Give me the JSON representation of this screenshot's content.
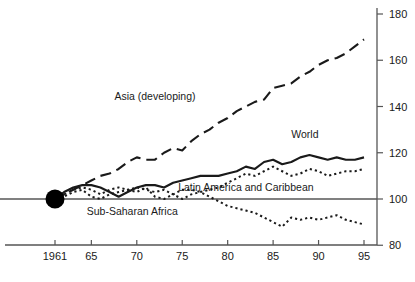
{
  "chart_data": {
    "type": "line",
    "title": "",
    "subtitle": "",
    "xlabel": "",
    "ylabel": "",
    "xlim": [
      1961,
      1996
    ],
    "ylim": [
      80,
      180
    ],
    "grid": false,
    "legend_position": "inline-annotations",
    "reference_line": {
      "value": 100,
      "color": "#808080",
      "label": ""
    },
    "origin_marker": {
      "x": 1961,
      "y": 100,
      "shape": "filled-circle",
      "color": "#000000"
    },
    "x_ticks": [
      {
        "value": 1961,
        "label": "1961"
      },
      {
        "value": 1965,
        "label": "65"
      },
      {
        "value": 1970,
        "label": "70"
      },
      {
        "value": 1975,
        "label": "75"
      },
      {
        "value": 1980,
        "label": "80"
      },
      {
        "value": 1985,
        "label": "85"
      },
      {
        "value": 1990,
        "label": "90"
      },
      {
        "value": 1995,
        "label": "95"
      }
    ],
    "y_ticks": [
      {
        "value": 80,
        "label": "80"
      },
      {
        "value": 100,
        "label": "100"
      },
      {
        "value": 120,
        "label": "120"
      },
      {
        "value": 140,
        "label": "140"
      },
      {
        "value": 160,
        "label": "160"
      },
      {
        "value": 180,
        "label": "180"
      }
    ],
    "x": [
      1961,
      1962,
      1963,
      1964,
      1965,
      1966,
      1967,
      1968,
      1969,
      1970,
      1971,
      1972,
      1973,
      1974,
      1975,
      1976,
      1977,
      1978,
      1979,
      1980,
      1981,
      1982,
      1983,
      1984,
      1985,
      1986,
      1987,
      1988,
      1989,
      1990,
      1991,
      1992,
      1993,
      1994,
      1995
    ],
    "series": [
      {
        "name": "Asia (developing)",
        "style": "long-dash",
        "color": "#1a1a1a",
        "label_x": 1972.0,
        "label_y": 143.0,
        "values": [
          100,
          102,
          104,
          106,
          108,
          110,
          111,
          113,
          116,
          118,
          117,
          117,
          120,
          122,
          121,
          125,
          128,
          130,
          133,
          135,
          138,
          140,
          142,
          143,
          148,
          149,
          150,
          153,
          155,
          158,
          160,
          161,
          163,
          166,
          169
        ]
      },
      {
        "name": "World",
        "style": "solid",
        "color": "#1a1a1a",
        "label_x": 1988.5,
        "label_y": 126.5,
        "values": [
          100,
          103,
          105,
          106,
          106,
          105,
          103,
          101,
          103,
          105,
          106,
          106,
          105,
          107,
          108,
          109,
          110,
          110,
          110,
          111,
          112,
          114,
          113,
          116,
          117,
          115,
          116,
          118,
          119,
          118,
          117,
          118,
          117,
          117,
          118
        ]
      },
      {
        "name": "Latin America and Caribbean",
        "style": "dotted",
        "color": "#1a1a1a",
        "label_x": 1982.0,
        "label_y": 103.5,
        "values": [
          100,
          101,
          103,
          104,
          101,
          100,
          102,
          103,
          104,
          105,
          104,
          103,
          104,
          102,
          100,
          102,
          103,
          104,
          105,
          107,
          109,
          111,
          110,
          112,
          114,
          112,
          110,
          111,
          113,
          112,
          110,
          111,
          112,
          112,
          113
        ]
      },
      {
        "name": "Sub-Saharan Africa",
        "style": "dotted",
        "color": "#1a1a1a",
        "label_x": 1969.5,
        "label_y": 93.0,
        "values": [
          100,
          102,
          104,
          105,
          104,
          102,
          104,
          105,
          104,
          103,
          105,
          101,
          100,
          102,
          104,
          104,
          103,
          101,
          99,
          97,
          96,
          95,
          94,
          92,
          90,
          88,
          92,
          91,
          92,
          91,
          92,
          93,
          91,
          90,
          89
        ]
      }
    ]
  }
}
